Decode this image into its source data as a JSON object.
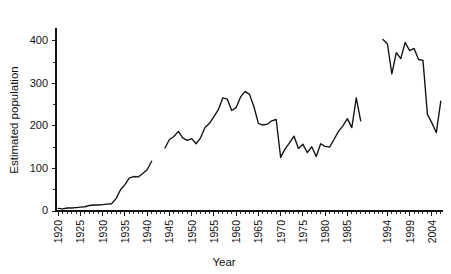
{
  "chart_data": {
    "type": "line",
    "title": "",
    "xlabel": "Year",
    "ylabel": "Estimated population",
    "xlim": [
      1919.5,
      2006.5
    ],
    "ylim": [
      0,
      430
    ],
    "yticks": [
      0,
      100,
      200,
      300,
      400
    ],
    "ytick_minor_step": 50,
    "xticks": [
      1920,
      1925,
      1930,
      1935,
      1940,
      1945,
      1950,
      1955,
      1960,
      1965,
      1970,
      1975,
      1980,
      1985,
      1994,
      1999,
      2004
    ],
    "xtick_minor_step": 1,
    "grid": false,
    "legend": false,
    "note": "Line broken into three segments; data missing 1942-1943 and 1989-1992",
    "series": [
      {
        "name": "Estimated population (1920-1941)",
        "x": [
          1920,
          1921,
          1922,
          1923,
          1924,
          1925,
          1926,
          1927,
          1928,
          1929,
          1930,
          1931,
          1932,
          1933,
          1934,
          1935,
          1936,
          1937,
          1938,
          1939,
          1940,
          1941
        ],
        "values": [
          6,
          5,
          7,
          7,
          8,
          9,
          10,
          13,
          14,
          14,
          15,
          16,
          17,
          29,
          50,
          62,
          78,
          81,
          80,
          88,
          97,
          117
        ]
      },
      {
        "name": "Estimated population (1944-1988)",
        "x": [
          1944,
          1945,
          1946,
          1947,
          1948,
          1949,
          1950,
          1951,
          1952,
          1953,
          1954,
          1955,
          1956,
          1957,
          1958,
          1959,
          1960,
          1961,
          1962,
          1963,
          1964,
          1965,
          1966,
          1967,
          1968,
          1969,
          1970,
          1971,
          1972,
          1973,
          1974,
          1975,
          1976,
          1977,
          1978,
          1979,
          1980,
          1981,
          1982,
          1983,
          1984,
          1985,
          1986,
          1987,
          1988
        ],
        "values": [
          148,
          168,
          175,
          187,
          172,
          166,
          170,
          158,
          172,
          196,
          206,
          222,
          238,
          266,
          263,
          236,
          243,
          268,
          281,
          274,
          245,
          206,
          202,
          204,
          212,
          215,
          126,
          146,
          160,
          176,
          147,
          157,
          137,
          151,
          128,
          158,
          152,
          150,
          168,
          187,
          200,
          217,
          196,
          266,
          212
        ]
      },
      {
        "name": "Estimated population (1993-2006)",
        "x": [
          1993,
          1994,
          1995,
          1996,
          1997,
          1998,
          1999,
          2000,
          2001,
          2002,
          2003,
          2004,
          2005,
          2006
        ],
        "values": [
          403,
          393,
          322,
          372,
          358,
          396,
          377,
          382,
          356,
          354,
          227,
          207,
          184,
          258
        ]
      }
    ]
  }
}
